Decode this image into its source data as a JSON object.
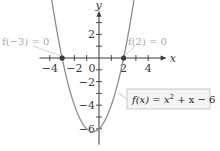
{
  "chart_data": {
    "type": "line",
    "title": "",
    "xlabel": "x",
    "ylabel": "y",
    "xlim": [
      -5,
      5.5
    ],
    "ylim": [
      -7,
      4
    ],
    "grid": false,
    "x_ticks": [
      -4,
      -3,
      -2,
      -1,
      1,
      2,
      3,
      4
    ],
    "x_tick_labels": [
      {
        "value": -4,
        "label": "−4"
      },
      {
        "value": -2,
        "label": "−2"
      },
      {
        "value": 0,
        "label": "0"
      },
      {
        "value": 2,
        "label": "2"
      },
      {
        "value": 4,
        "label": "4"
      }
    ],
    "y_ticks": [
      -6,
      -5,
      -4,
      -3,
      -2,
      -1,
      1,
      2,
      3
    ],
    "y_tick_labels": [
      {
        "value": 2,
        "label": "2"
      },
      {
        "value": -2,
        "label": "−2"
      },
      {
        "value": -4,
        "label": "−4"
      },
      {
        "value": -6,
        "label": "−6"
      }
    ],
    "series": [
      {
        "name": "f(x) = x^2 + x - 6",
        "coefficients": {
          "a": 1,
          "b": 1,
          "c": -6
        },
        "x_range": [
          -3.9,
          3.0
        ],
        "color": "#8c8c8c"
      }
    ],
    "points": [
      {
        "x": -3,
        "y": 0,
        "label": "f(−3) = 0"
      },
      {
        "x": 2,
        "y": 0,
        "label": "f(2) = 0"
      }
    ],
    "legend": {
      "text_fx": "f(x) = x",
      "text_exp": "2",
      "text_rest": " + x − 6",
      "placement": "bottom-right"
    },
    "colors": {
      "curve": "#8c8c8c",
      "axis": "#3a3a3a",
      "point": "#3a3a3a",
      "annotation": "#a8a8a8",
      "legend_bg": "#f4f4f4",
      "legend_border": "#bdbdbd"
    }
  }
}
